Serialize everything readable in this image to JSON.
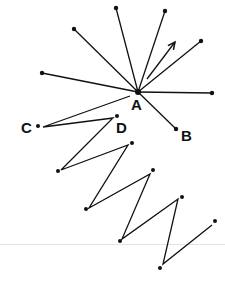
{
  "diagram": {
    "stroke_color": "#111111",
    "divider_color": "#e2e2e2",
    "labels": [
      {
        "text": "A",
        "x": 131,
        "y": 97
      },
      {
        "text": "B",
        "x": 181,
        "y": 128
      },
      {
        "text": "C",
        "x": 21,
        "y": 120
      },
      {
        "text": "D",
        "x": 116,
        "y": 120
      }
    ],
    "center": {
      "x": 138,
      "y": 92
    },
    "rays": [
      {
        "x": 116,
        "y": 8
      },
      {
        "x": 165,
        "y": 11
      },
      {
        "x": 74,
        "y": 29
      },
      {
        "x": 201,
        "y": 41
      },
      {
        "x": 42,
        "y": 73
      },
      {
        "x": 212,
        "y": 93
      },
      {
        "x": 176,
        "y": 129
      }
    ],
    "ray_dots": [
      {
        "x": 116,
        "y": 8
      },
      {
        "x": 165,
        "y": 11
      },
      {
        "x": 74,
        "y": 29
      },
      {
        "x": 201,
        "y": 41
      },
      {
        "x": 42,
        "y": 73
      },
      {
        "x": 212,
        "y": 93
      },
      {
        "x": 176,
        "y": 129
      }
    ],
    "arrow": {
      "from": {
        "x": 147,
        "y": 79
      },
      "to": {
        "x": 175,
        "y": 42
      }
    },
    "zigzag": [
      {
        "x": 130,
        "y": 96
      },
      {
        "x": 43,
        "y": 127
      },
      {
        "x": 113,
        "y": 118
      },
      {
        "x": 61,
        "y": 170
      },
      {
        "x": 128,
        "y": 145
      },
      {
        "x": 89,
        "y": 208
      },
      {
        "x": 150,
        "y": 174
      },
      {
        "x": 122,
        "y": 239
      },
      {
        "x": 178,
        "y": 199
      },
      {
        "x": 163,
        "y": 264
      },
      {
        "x": 212,
        "y": 225
      }
    ],
    "zigzag_dots": [
      {
        "x": 38,
        "y": 126
      },
      {
        "x": 117,
        "y": 116
      },
      {
        "x": 58,
        "y": 171
      },
      {
        "x": 132,
        "y": 143
      },
      {
        "x": 86,
        "y": 209
      },
      {
        "x": 153,
        "y": 170
      },
      {
        "x": 120,
        "y": 241
      },
      {
        "x": 182,
        "y": 197
      },
      {
        "x": 160,
        "y": 268
      },
      {
        "x": 215,
        "y": 221
      }
    ],
    "divider_y": 244
  }
}
